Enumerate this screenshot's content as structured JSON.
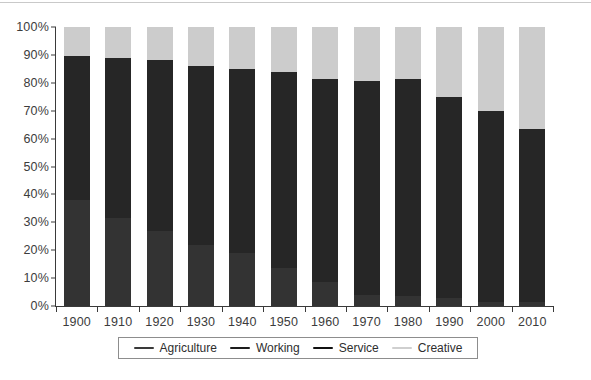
{
  "chart_data": {
    "type": "bar",
    "subtype": "stacked-100-percent",
    "title": "",
    "subtitle": "",
    "xlabel": "",
    "ylabel": "",
    "ylim": [
      0,
      100
    ],
    "ytick_labels": [
      "0%",
      "10%",
      "20%",
      "30%",
      "40%",
      "50%",
      "60%",
      "70%",
      "80%",
      "90%",
      "100%"
    ],
    "ytick_values": [
      0,
      10,
      20,
      30,
      40,
      50,
      60,
      70,
      80,
      90,
      100
    ],
    "grid": false,
    "legend_position": "bottom",
    "categories": [
      "1900",
      "1910",
      "1920",
      "1930",
      "1940",
      "1950",
      "1960",
      "1970",
      "1980",
      "1990",
      "2000",
      "2010"
    ],
    "series": [
      {
        "name": "Agriculture",
        "color": "#333333",
        "values": [
          38,
          31.5,
          27,
          22,
          19,
          13.5,
          8.5,
          4,
          3.5,
          3,
          1.5,
          1.5
        ]
      },
      {
        "name": "Working",
        "color": "#262626",
        "values": [
          51.5,
          57.5,
          61,
          64,
          66,
          70.5,
          73,
          76.5,
          78,
          72,
          68.5,
          62
        ]
      },
      {
        "name": "Service",
        "color": "#1a1a1a",
        "values": [
          0,
          0,
          0,
          0,
          0,
          0,
          0,
          0,
          0,
          0,
          0,
          0
        ]
      },
      {
        "name": "Creative",
        "color": "#cccccc",
        "values": [
          10.5,
          11,
          12,
          14,
          15,
          16,
          18.5,
          19.5,
          18.5,
          25,
          30,
          36.5
        ]
      }
    ],
    "totals": [
      100,
      100,
      100,
      100,
      100,
      100,
      100,
      100,
      100,
      100,
      100,
      100
    ]
  },
  "legend": {
    "items": [
      {
        "label": "Agriculture",
        "color": "#3a3a3a"
      },
      {
        "label": "Working",
        "color": "#1d1d1d"
      },
      {
        "label": "Service",
        "color": "#111111"
      },
      {
        "label": "Creative",
        "color": "#cfcfcf"
      }
    ]
  },
  "caption": ""
}
